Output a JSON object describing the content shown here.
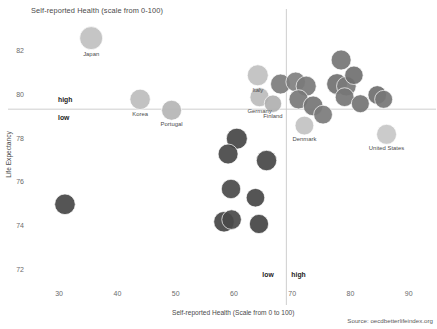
{
  "chart_data": {
    "type": "scatter",
    "title": "Self-reported Health (scale from 0-100)",
    "xlabel": "Self-reported Health (Scale from 0 to 100)",
    "ylabel": "Life Expectancy",
    "xlim": [
      25,
      94
    ],
    "ylim": [
      71.4,
      83.2
    ],
    "xticks": [
      30,
      40,
      50,
      60,
      70,
      80,
      90
    ],
    "yticks": [
      72,
      74,
      76,
      78,
      80,
      82
    ],
    "grid": false,
    "legend": null,
    "source": "Source: oecdbetterlifeindex.org",
    "reference_lines": {
      "vertical_x": 69,
      "horizontal_y": 79.35,
      "quadrant_labels": [
        {
          "text": "high",
          "position": "above-left"
        },
        {
          "text": "low",
          "position": "below-left"
        },
        {
          "text": "low",
          "position": "bottom-left-of-vline"
        },
        {
          "text": "high",
          "position": "bottom-right-of-vline"
        }
      ]
    },
    "colors": {
      "light": "#c3c3c3",
      "medium_light": "#a8a8a8",
      "medium": "#8c8c8c",
      "dark_gray": "#6e6e6e",
      "darkest": "#4a4a4a",
      "axis": "#c8c8c8",
      "text": "#4a4a4a"
    },
    "points": [
      {
        "label": "Japan",
        "x": 35.5,
        "y": 82.6,
        "r": 11.5,
        "color": "#c0c0c0"
      },
      {
        "label": "Korea",
        "x": 43.9,
        "y": 79.8,
        "r": 10.2,
        "color": "#bdbdbd"
      },
      {
        "label": "Portugal",
        "x": 49.3,
        "y": 79.3,
        "r": 10.0,
        "color": "#b5b5b5"
      },
      {
        "label": "Italy",
        "x": 64.1,
        "y": 80.9,
        "r": 10.5,
        "color": "#c0c0c0"
      },
      {
        "label": "Germany",
        "x": 64.4,
        "y": 79.9,
        "r": 9.6,
        "color": "#bcbcbc"
      },
      {
        "label": "Finland",
        "x": 66.7,
        "y": 79.6,
        "r": 8.7,
        "color": "#b0b0b0"
      },
      {
        "label": "Denmark",
        "x": 72.1,
        "y": 78.6,
        "r": 9.4,
        "color": "#c2c2c2"
      },
      {
        "label": "United States",
        "x": 86.2,
        "y": 78.2,
        "r": 10.0,
        "color": "#c7c7c7"
      },
      {
        "label": "",
        "x": 68.0,
        "y": 80.5,
        "r": 10.0,
        "color": "#7c7c7c"
      },
      {
        "label": "",
        "x": 70.6,
        "y": 80.6,
        "r": 9.8,
        "color": "#808080"
      },
      {
        "label": "",
        "x": 72.4,
        "y": 80.4,
        "r": 10.1,
        "color": "#7a7a7a"
      },
      {
        "label": "",
        "x": 71.1,
        "y": 79.8,
        "r": 9.6,
        "color": "#787878"
      },
      {
        "label": "",
        "x": 73.6,
        "y": 79.5,
        "r": 9.9,
        "color": "#757575"
      },
      {
        "label": "",
        "x": 75.3,
        "y": 79.1,
        "r": 9.4,
        "color": "#7b7b7b"
      },
      {
        "label": "",
        "x": 78.4,
        "y": 81.6,
        "r": 10.0,
        "color": "#757575"
      },
      {
        "label": "",
        "x": 77.7,
        "y": 80.5,
        "r": 10.4,
        "color": "#717171"
      },
      {
        "label": "",
        "x": 79.3,
        "y": 80.4,
        "r": 9.8,
        "color": "#7a7a7a"
      },
      {
        "label": "",
        "x": 79.0,
        "y": 79.9,
        "r": 9.4,
        "color": "#767676"
      },
      {
        "label": "",
        "x": 80.6,
        "y": 80.9,
        "r": 9.2,
        "color": "#707070"
      },
      {
        "label": "",
        "x": 81.7,
        "y": 79.6,
        "r": 9.0,
        "color": "#747474"
      },
      {
        "label": "",
        "x": 84.6,
        "y": 80.0,
        "r": 9.3,
        "color": "#6f6f6f"
      },
      {
        "label": "",
        "x": 85.7,
        "y": 79.8,
        "r": 9.0,
        "color": "#767676"
      },
      {
        "label": "",
        "x": 60.5,
        "y": 78.0,
        "r": 10.5,
        "color": "#454545"
      },
      {
        "label": "",
        "x": 59.0,
        "y": 77.3,
        "r": 10.0,
        "color": "#484848"
      },
      {
        "label": "",
        "x": 65.6,
        "y": 77.0,
        "r": 10.2,
        "color": "#464646"
      },
      {
        "label": "",
        "x": 59.5,
        "y": 75.7,
        "r": 9.7,
        "color": "#4a4a4a"
      },
      {
        "label": "",
        "x": 63.7,
        "y": 75.3,
        "r": 9.3,
        "color": "#474747"
      },
      {
        "label": "",
        "x": 31.0,
        "y": 75.0,
        "r": 10.3,
        "color": "#464646"
      },
      {
        "label": "",
        "x": 58.3,
        "y": 74.2,
        "r": 10.3,
        "color": "#454545"
      },
      {
        "label": "",
        "x": 59.6,
        "y": 74.3,
        "r": 9.8,
        "color": "#4a4a4a"
      },
      {
        "label": "",
        "x": 64.3,
        "y": 74.1,
        "r": 9.6,
        "color": "#444444"
      }
    ]
  }
}
